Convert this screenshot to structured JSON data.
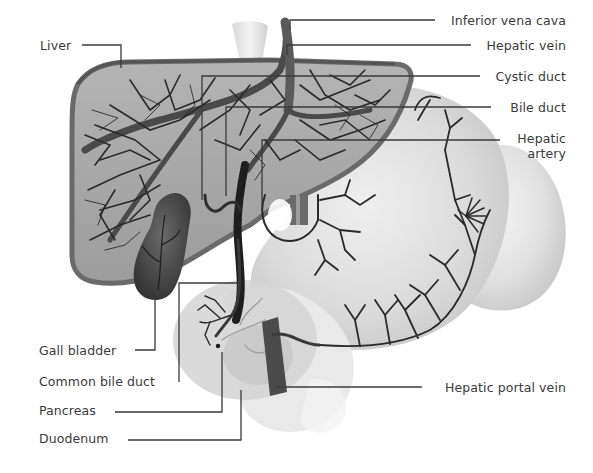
{
  "diagram": {
    "colors": {
      "background": "#ffffff",
      "liver_fill": "#a8a8a8",
      "liver_rim": "#6e6e6e",
      "vessel": "#3c3c3c",
      "vessel_dark": "#1e1e1e",
      "gallbladder": "#4a4a4a",
      "stomach_fill": "#dcdcdc",
      "spleen_fill": "#e4e4e4",
      "duodenum_fill": "#e8e8e8",
      "pancreas_fill": "#cfcfcf",
      "portal_vein": "#4b4b4b",
      "leader_line": "#3a3a3a",
      "label_text": "#3a3a3a"
    },
    "labels_left": [
      {
        "id": "liver",
        "text": "Liver"
      },
      {
        "id": "gall-bladder",
        "text": "Gall bladder"
      },
      {
        "id": "common-bile-duct",
        "text": "Common bile duct"
      },
      {
        "id": "pancreas",
        "text": "Pancreas"
      },
      {
        "id": "duodenum",
        "text": "Duodenum"
      }
    ],
    "labels_right": [
      {
        "id": "inferior-vena-cava",
        "text": "Inferior vena cava"
      },
      {
        "id": "hepatic-vein",
        "text": "Hepatic vein"
      },
      {
        "id": "cystic-duct",
        "text": "Cystic duct"
      },
      {
        "id": "bile-duct",
        "text": "Bile duct"
      },
      {
        "id": "hepatic-artery",
        "text": "Hepatic\nartery"
      },
      {
        "id": "hepatic-portal-vein",
        "text": "Hepatic portal vein"
      }
    ]
  }
}
